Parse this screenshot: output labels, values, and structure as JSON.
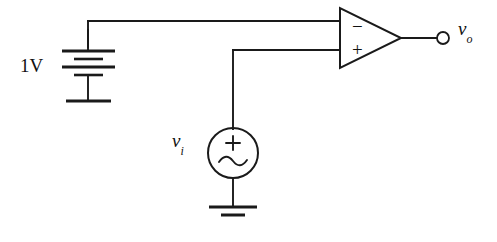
{
  "diagram": {
    "type": "electronic-schematic",
    "stroke_color": "#1a1a1a",
    "background_color": "#ffffff"
  },
  "labels": {
    "battery_value": "1V",
    "input_source_symbol": "v",
    "input_source_subscript": "i",
    "output_terminal_symbol": "v",
    "output_terminal_subscript": "o"
  },
  "opamp": {
    "inverting_sign": "−",
    "noninverting_sign": "+",
    "inverting_input_position": "top",
    "noninverting_input_position": "bottom"
  },
  "ac_source": {
    "polarity_sign": "+",
    "waveform": "sine"
  },
  "components": [
    {
      "name": "dc-voltage-source",
      "label": "1V",
      "kind": "battery-multicell",
      "cells": 2
    },
    {
      "name": "ac-voltage-source",
      "label": "vi",
      "kind": "ac-source-circle"
    },
    {
      "name": "operational-amplifier",
      "label": "",
      "kind": "opamp-triangle"
    },
    {
      "name": "ground-battery",
      "label": "",
      "kind": "earth-ground"
    },
    {
      "name": "ground-ac-source",
      "label": "",
      "kind": "earth-ground"
    },
    {
      "name": "output-terminal",
      "label": "vo",
      "kind": "open-terminal"
    }
  ]
}
